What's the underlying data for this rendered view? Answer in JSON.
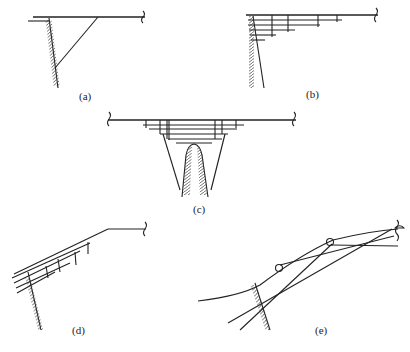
{
  "figure": {
    "panels": [
      {
        "id": "a",
        "label": "(a)",
        "description": "Cantilever deck with single inclined strut to wall"
      },
      {
        "id": "b",
        "label": "(b)",
        "description": "Stacked corbelled beams projecting from wall"
      },
      {
        "id": "c",
        "label": "(c)",
        "description": "Stacked beams with struts over central pier"
      },
      {
        "id": "d",
        "label": "(d)",
        "description": "Inclined stacked beams from wall"
      },
      {
        "id": "e",
        "label": "(e)",
        "description": "Curved arch with crossing struts from abutment"
      }
    ]
  }
}
